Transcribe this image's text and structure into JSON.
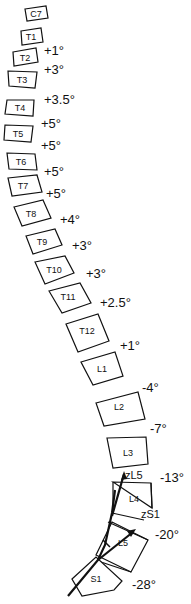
{
  "diagram": {
    "type": "sagittal spine segmental angles",
    "vertebrae": [
      {
        "label": "C7"
      },
      {
        "label": "T1"
      },
      {
        "label": "T2"
      },
      {
        "label": "T3"
      },
      {
        "label": "T4"
      },
      {
        "label": "T5"
      },
      {
        "label": "T6"
      },
      {
        "label": "T7"
      },
      {
        "label": "T8"
      },
      {
        "label": "T9"
      },
      {
        "label": "T10"
      },
      {
        "label": "T11"
      },
      {
        "label": "T12"
      },
      {
        "label": "L1"
      },
      {
        "label": "L2"
      },
      {
        "label": "L3"
      },
      {
        "label": "L4"
      },
      {
        "label": "L5"
      },
      {
        "label": "S1"
      }
    ],
    "angles": [
      "+1°",
      "+3°",
      "+3.5°",
      "+5°",
      "+5°",
      "+5°",
      "+5°",
      "+4°",
      "+3°",
      "+3°",
      "+2.5°",
      "+1°",
      "-4°",
      "-7°",
      "-13°",
      "-20°",
      "-28°"
    ],
    "axis_labels": {
      "zL5": "zL5",
      "zS1": "zS1"
    }
  }
}
